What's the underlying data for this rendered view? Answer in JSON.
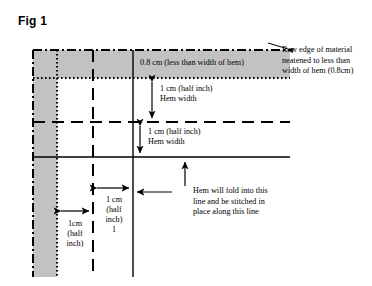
{
  "figure": {
    "title": "Fig 1",
    "type": "sewing-hem-construction-diagram",
    "colors": {
      "shading": "#c0c0c0",
      "line": "#000000",
      "background": "#ffffff"
    }
  },
  "labels": {
    "top_band": "0.8 cm (less than width of hem)",
    "raw_edge_callout": "Raw edge of material\nneatened to less than\nwidth of hem (0.8cm)",
    "hem_width_1": "1 cm (half inch)\nHem width",
    "hem_width_2": "1 cm (half inch)\nHem width",
    "fold_line_callout": "Hem will fold into this\nline and be stitched in\nplace along this line",
    "measure_left": "1cm\n(half\ninch)",
    "measure_middle": "1 cm\n(half\ninch)\n1"
  },
  "geometry": {
    "grid": {
      "vertical_lines": [
        {
          "x": 33,
          "style": "dash-dot"
        },
        {
          "x": 57,
          "style": "dotted"
        },
        {
          "x": 93,
          "style": "dashed"
        },
        {
          "x": 133,
          "style": "solid"
        }
      ],
      "horizontal_lines": [
        {
          "y": 50,
          "style": "dash-dot"
        },
        {
          "y": 78,
          "style": "dotted"
        },
        {
          "y": 122,
          "style": "dashed"
        },
        {
          "y": 157,
          "style": "solid"
        }
      ],
      "extent": {
        "left": 33,
        "right": 290,
        "top": 50,
        "bottom": 277
      }
    },
    "shaded_regions": [
      {
        "name": "top-band",
        "x": 33,
        "y": 50,
        "w": 257,
        "h": 28
      },
      {
        "name": "left-column",
        "x": 33,
        "y": 78,
        "w": 24,
        "h": 199
      }
    ]
  },
  "measurements": {
    "raw_edge_width_cm": 0.8,
    "hem_width_cm": 1,
    "hem_width_inch": 0.5
  }
}
